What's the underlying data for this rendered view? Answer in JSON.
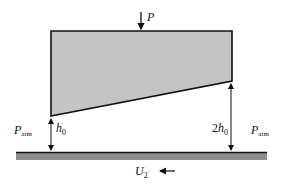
{
  "diagram": {
    "labels": {
      "load": "P",
      "p_left_main": "P",
      "p_left_sub": "atm",
      "p_right_main": "P",
      "p_right_sub": "atm",
      "h_left_main": "h",
      "h_left_sub": "0",
      "h_right_coef": "2",
      "h_right_main": "h",
      "h_right_sub": "0",
      "velocity_main": "U",
      "velocity_sub": "2"
    },
    "colors": {
      "slider_fill": "#c4c4c4",
      "plate_fill": "#8e8e8e",
      "stroke": "#111111"
    }
  }
}
